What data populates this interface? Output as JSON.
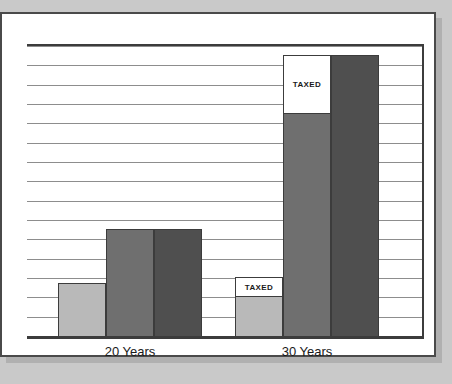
{
  "chart_data": {
    "type": "bar",
    "title": "",
    "subtitle": "",
    "xlabel": "",
    "ylabel": "",
    "categories": [
      "20 Years",
      "30 Years"
    ],
    "grid": true,
    "gridline_count": 15,
    "legend_position": "none",
    "ylim": [
      0,
      15
    ],
    "y_tick_labels": [],
    "x_tick_labels": [
      "20 Years",
      "30 Years"
    ],
    "annotations": [
      "TAXED",
      "TAXED"
    ],
    "series": [
      {
        "name": "series-1-light",
        "color": "#b9b9b9",
        "values": [
          2.8,
          2.1
        ],
        "taxed_cap": [
          0,
          1.0
        ]
      },
      {
        "name": "series-2-medium",
        "color": "#6f6f6f",
        "values": [
          5.6,
          11.6
        ],
        "taxed_cap": [
          0,
          3.0
        ]
      },
      {
        "name": "series-3-dark",
        "color": "#4f4f4f",
        "values": [
          5.6,
          14.6
        ],
        "taxed_cap": [
          0,
          0
        ]
      }
    ]
  },
  "colors": {
    "backdrop": "#c9c9c9",
    "panel": "#ffffff",
    "frame": "#4a4a4a",
    "axis": "#3c3c3c",
    "gridline": "#8d8d8d",
    "light_bar": "#b9b9b9",
    "medium_bar": "#6f6f6f",
    "dark_bar": "#4f4f4f",
    "taxed_fill": "#ffffff",
    "text": "#1a1a1a"
  },
  "groups": [
    {
      "label": "20 Years",
      "bars": [
        {
          "name": "bar-20y-light",
          "tone": "light",
          "height_units": 2.8,
          "taxed_units": 0,
          "taxed_label": ""
        },
        {
          "name": "bar-20y-medium",
          "tone": "medium",
          "height_units": 5.6,
          "taxed_units": 0,
          "taxed_label": ""
        },
        {
          "name": "bar-20y-dark",
          "tone": "dark",
          "height_units": 5.6,
          "taxed_units": 0,
          "taxed_label": ""
        }
      ]
    },
    {
      "label": "30 Years",
      "bars": [
        {
          "name": "bar-30y-light",
          "tone": "light",
          "height_units": 3.1,
          "taxed_units": 1.0,
          "taxed_label": "TAXED"
        },
        {
          "name": "bar-30y-medium",
          "tone": "medium",
          "height_units": 14.6,
          "taxed_units": 3.0,
          "taxed_label": "TAXED"
        },
        {
          "name": "bar-30y-dark",
          "tone": "dark",
          "height_units": 14.6,
          "taxed_units": 0,
          "taxed_label": ""
        }
      ]
    }
  ],
  "axis_labels": {
    "group_1": "20 Years",
    "group_2": "30 Years"
  }
}
